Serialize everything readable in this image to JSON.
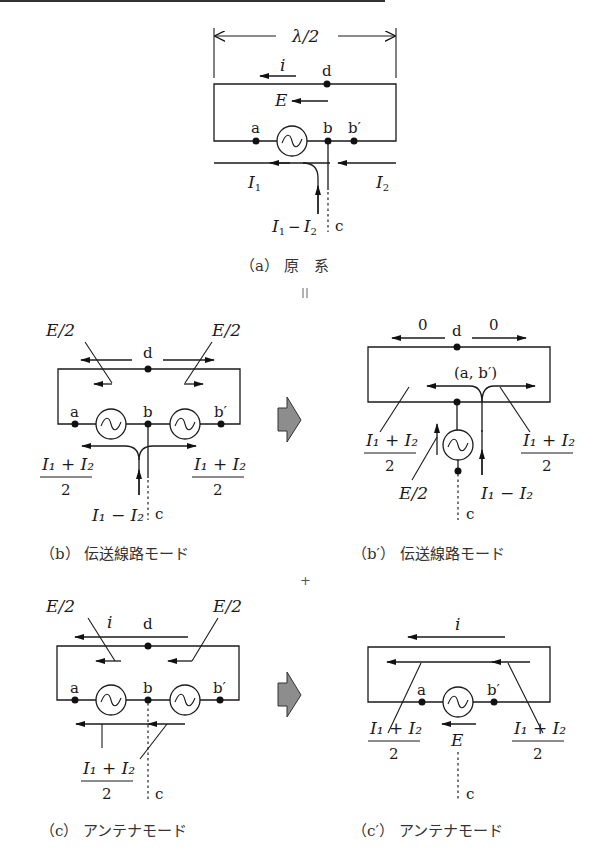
{
  "figure": {
    "top_rule": true,
    "panels": {
      "a": {
        "caption": "（a） 原　系",
        "width_label": "λ/2",
        "labels": {
          "i": "i",
          "E": "E",
          "d": "d",
          "a": "a",
          "b": "b",
          "b_prime": "b′",
          "c": "c",
          "I1": "I",
          "I1_sub": "1",
          "I2": "I",
          "I2_sub": "2",
          "diff_I": "I",
          "diff_sub1": "1",
          "diff_op": "−",
          "diff_I2": "I",
          "diff_sub2": "2"
        }
      },
      "b": {
        "caption": "（b） 伝送線路モード",
        "labels": {
          "E_half_left": "E/2",
          "E_half_right": "E/2",
          "d": "d",
          "a": "a",
          "b": "b",
          "b_prime": "b′",
          "c": "c",
          "sum_num": "I₁ + I₂",
          "sum_den": "2",
          "diff": "I₁ − I₂"
        }
      },
      "b_prime": {
        "caption": "（b′） 伝送線路モード",
        "labels": {
          "zero_left": "0",
          "zero_right": "0",
          "d": "d",
          "ab_prime": "(a, b′)",
          "c": "c",
          "sum_num": "I₁ + I₂",
          "sum_den": "2",
          "E_half": "E/2",
          "diff": "I₁ − I₂"
        }
      },
      "c": {
        "caption": "（c） アンテナモード",
        "labels": {
          "E_half_left": "E/2",
          "E_half_right": "E/2",
          "i": "i",
          "d": "d",
          "a": "a",
          "b": "b",
          "b_prime": "b′",
          "c": "c",
          "sum_num": "I₁ + I₂",
          "sum_den": "2"
        }
      },
      "c_prime": {
        "caption": "（c′） アンテナモード",
        "labels": {
          "i": "i",
          "a": "a",
          "b_prime": "b′",
          "E": "E",
          "c": "c",
          "sum_num": "I₁ + I₂",
          "sum_den": "2"
        }
      }
    },
    "operators": {
      "equals": "=",
      "plus": "+"
    },
    "colors": {
      "line": "#1a1a1a",
      "arrow_fill": "#8d8d8d",
      "background": "#ffffff"
    }
  }
}
